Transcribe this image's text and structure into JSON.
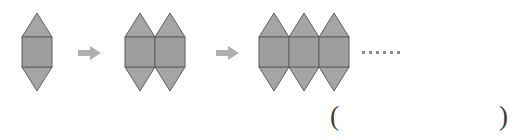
{
  "canvas": {
    "width": 517,
    "height": 140,
    "background": "#ffffff"
  },
  "colors": {
    "shape_fill": "#9d9d9d",
    "triangle_fill": "#a5a5a5",
    "shape_stroke": "#5e5e5e",
    "arrow_fill": "#b0b0b0",
    "dot_color": "#8d8d8d",
    "paren_color": "#3a3a3a"
  },
  "sequence": {
    "label": "shape-growth-pattern",
    "unit_description": "square with an upward triangle on top and a downward triangle below",
    "steps": [
      {
        "index": 1,
        "units": 1,
        "x": 22,
        "name": "figure-step-1"
      },
      {
        "index": 2,
        "units": 2,
        "x": 125,
        "name": "figure-step-2"
      },
      {
        "index": 3,
        "units": 3,
        "x": 259,
        "name": "figure-step-3"
      }
    ],
    "arrows": [
      {
        "index": 1,
        "x": 78,
        "y": 46,
        "glyph": "arrow-right"
      },
      {
        "index": 2,
        "x": 216,
        "y": 46,
        "glyph": "arrow-right"
      }
    ],
    "ellipsis": {
      "x": 362,
      "y": 51,
      "dots": 6,
      "text": "……"
    },
    "geometry": {
      "square_size": 30,
      "triangle_height": 24,
      "square_top_y": 37
    }
  },
  "answer_blank": {
    "open_paren": "(",
    "close_paren": ")",
    "open_x": 330,
    "close_x": 499,
    "y": 103
  }
}
